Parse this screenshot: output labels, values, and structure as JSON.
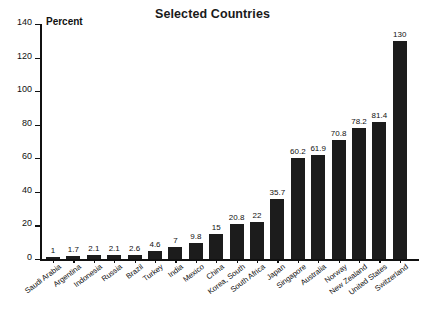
{
  "chart_data": {
    "type": "bar",
    "title": "Selected Countries",
    "xlabel": "",
    "ylabel": "Percent",
    "ylim": [
      0,
      140
    ],
    "yticks": [
      0,
      20,
      40,
      60,
      80,
      100,
      120,
      140
    ],
    "grid": false,
    "legend": null,
    "orientation": "vertical",
    "bar_color": "#1c1c1c",
    "value_labels_shown": true,
    "categories": [
      "Saudi Arabia",
      "Argentina",
      "Indonesia",
      "Russia",
      "Brazil",
      "Turkey",
      "India",
      "Mexico",
      "China",
      "Korea, South",
      "South Africa",
      "Japan",
      "Singapore",
      "Australia",
      "Norway",
      "New Zealand",
      "United States",
      "Switzerland"
    ],
    "values": [
      1,
      1.7,
      2.1,
      2.1,
      2.6,
      4.6,
      7,
      9.8,
      15,
      20.8,
      22,
      35.7,
      60.2,
      61.9,
      70.8,
      78.2,
      81.4,
      130
    ],
    "value_label_texts": [
      "1",
      "1.7",
      "2.1",
      "2.1",
      "2.6",
      "4.6",
      "7",
      "9.8",
      "15",
      "20.8",
      "22",
      "35.7",
      "60.2",
      "61.9",
      "70.8",
      "78.2",
      "81.4",
      "130"
    ],
    "ytick_labels": [
      "0",
      "20",
      "40",
      "60",
      "80",
      "100",
      "120",
      "140"
    ]
  },
  "axis": {
    "unit_label": "Percent"
  }
}
